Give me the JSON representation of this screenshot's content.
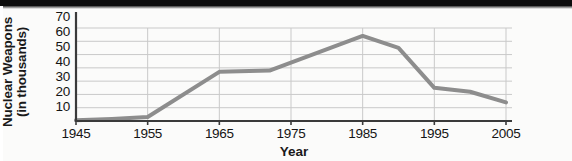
{
  "figure": {
    "name": "nuclear-weapons-line-chart",
    "background_color": "#fbfbfa",
    "line_color": "#8d8d8d",
    "axis_color": "#3a3a3a",
    "grid_color": "#c9c9c9",
    "text_color": "#141414"
  },
  "chart_data": {
    "type": "line",
    "title": "",
    "subtitle": "",
    "xlabel": "Year",
    "ylabel": "Nuclear Weapons (in thousands)",
    "ylabel_lines": [
      "Nuclear Weapons",
      "(in thousands)"
    ],
    "xlim": [
      1945,
      2005
    ],
    "ylim": [
      0,
      70
    ],
    "xticks": [
      1945,
      1955,
      1965,
      1975,
      1985,
      1995,
      2005
    ],
    "xtick_labels": [
      "1945",
      "1955",
      "1965",
      "1975",
      "1985",
      "1995",
      "2005"
    ],
    "yticks": [
      10,
      20,
      30,
      40,
      50,
      60,
      70
    ],
    "ytick_labels": [
      "10",
      "20",
      "30",
      "40",
      "50",
      "60",
      "70"
    ],
    "grid": "horizontal-and-vertical",
    "legend": "none",
    "series": [
      {
        "name": "Nuclear Weapons",
        "x": [
          1945,
          1950,
          1955,
          1965,
          1972,
          1985,
          1990,
          1995,
          2000,
          2005
        ],
        "values": [
          0.5,
          1.5,
          3,
          37,
          38,
          64,
          55,
          25,
          22,
          14
        ]
      }
    ],
    "annotations": []
  }
}
